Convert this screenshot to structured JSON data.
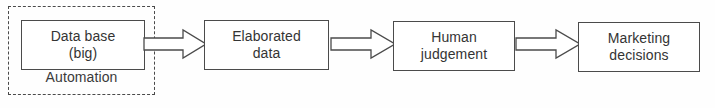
{
  "diagram": {
    "background_color": "#fefefe",
    "stroke_color": "#4b4b4b",
    "text_color": "#343434",
    "group": {
      "caption": "Automation",
      "border_style": "dashed",
      "border_color": "#4a4a4a"
    },
    "nodes": [
      {
        "id": "database",
        "label": "Data base\n(big)"
      },
      {
        "id": "elaborated",
        "label": "Elaborated\ndata"
      },
      {
        "id": "human",
        "label": "Human\njudgement"
      },
      {
        "id": "marketing",
        "label": "Marketing\ndecisions"
      }
    ],
    "connectors": [
      {
        "id": "arrow-1",
        "from": "database",
        "to": "elaborated",
        "icon": "block-arrow-right-icon",
        "label": ""
      },
      {
        "id": "arrow-2",
        "from": "elaborated",
        "to": "human",
        "icon": "block-arrow-right-icon",
        "label": ""
      },
      {
        "id": "arrow-3",
        "from": "human",
        "to": "marketing",
        "icon": "block-arrow-right-icon",
        "label": ""
      }
    ]
  }
}
